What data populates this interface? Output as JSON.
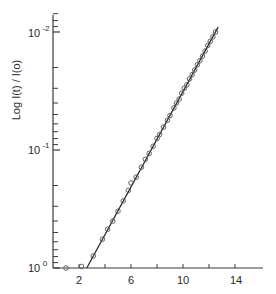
{
  "chart_data": {
    "type": "scatter",
    "title": "",
    "xlabel": "",
    "ylabel": "Log I(t) / I(o)",
    "y_scale": "log",
    "y_inverted": true,
    "xlim": [
      0,
      16
    ],
    "ylim": [
      1,
      0.01
    ],
    "x_ticks": [
      2,
      4,
      6,
      8,
      10,
      12,
      14
    ],
    "x_tick_labels": [
      "2",
      "",
      "6",
      "",
      "10",
      "",
      "14"
    ],
    "y_tick_labels": [
      {
        "label": "10",
        "exp": "0",
        "value": 1
      },
      {
        "label": "10",
        "exp": "-1",
        "value": 0.1
      },
      {
        "label": "10",
        "exp": "-2",
        "value": 0.01
      }
    ],
    "grid": false,
    "legend": null,
    "series": [
      {
        "name": "data",
        "marker": "open-circle",
        "points": [
          {
            "x": 1.0,
            "y": 1.0
          },
          {
            "x": 2.2,
            "y": 0.97
          },
          {
            "x": 3.1,
            "y": 0.79
          },
          {
            "x": 3.8,
            "y": 0.57
          },
          {
            "x": 4.2,
            "y": 0.47
          },
          {
            "x": 4.6,
            "y": 0.4
          },
          {
            "x": 5.0,
            "y": 0.33
          },
          {
            "x": 5.4,
            "y": 0.27
          },
          {
            "x": 5.8,
            "y": 0.22
          },
          {
            "x": 6.0,
            "y": 0.19
          },
          {
            "x": 6.4,
            "y": 0.17
          },
          {
            "x": 6.8,
            "y": 0.14
          },
          {
            "x": 7.1,
            "y": 0.12
          },
          {
            "x": 7.4,
            "y": 0.107
          },
          {
            "x": 7.7,
            "y": 0.093
          },
          {
            "x": 8.0,
            "y": 0.08
          },
          {
            "x": 8.2,
            "y": 0.074
          },
          {
            "x": 8.5,
            "y": 0.064
          },
          {
            "x": 8.8,
            "y": 0.056
          },
          {
            "x": 9.0,
            "y": 0.051
          },
          {
            "x": 9.3,
            "y": 0.044
          },
          {
            "x": 9.5,
            "y": 0.04
          },
          {
            "x": 9.7,
            "y": 0.037
          },
          {
            "x": 9.9,
            "y": 0.033
          },
          {
            "x": 10.1,
            "y": 0.03
          },
          {
            "x": 10.3,
            "y": 0.028
          },
          {
            "x": 10.5,
            "y": 0.025
          },
          {
            "x": 10.7,
            "y": 0.023
          },
          {
            "x": 10.9,
            "y": 0.021
          },
          {
            "x": 11.1,
            "y": 0.019
          },
          {
            "x": 11.3,
            "y": 0.0175
          },
          {
            "x": 11.5,
            "y": 0.016
          },
          {
            "x": 11.7,
            "y": 0.0145
          },
          {
            "x": 11.9,
            "y": 0.013
          },
          {
            "x": 12.1,
            "y": 0.012
          },
          {
            "x": 12.3,
            "y": 0.011
          },
          {
            "x": 12.5,
            "y": 0.01
          }
        ]
      },
      {
        "name": "fit",
        "type": "line",
        "points": [
          {
            "x": 2.6,
            "y": 1.0
          },
          {
            "x": 12.7,
            "y": 0.0091
          }
        ]
      }
    ]
  },
  "axes": {
    "ylabel": "Log  I(t) / I(o)",
    "x_labels": [
      "2",
      "6",
      "10",
      "14"
    ],
    "y_labels": [
      {
        "base": "10",
        "exp": "0"
      },
      {
        "base": "10",
        "exp": "-1"
      },
      {
        "base": "10",
        "exp": "-2"
      }
    ]
  }
}
